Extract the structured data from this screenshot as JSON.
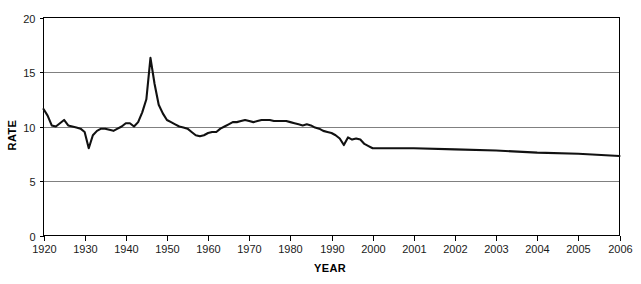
{
  "chart_data": {
    "type": "line",
    "title": "",
    "xlabel": "YEAR",
    "ylabel": "RATE",
    "ylim": [
      0,
      20
    ],
    "yticks": [
      0,
      5,
      10,
      15,
      20
    ],
    "grid": "horizontal",
    "legend": "none",
    "x_axis_note": "Non-linear axis: evenly spaced decade ticks 1920-2000, then evenly spaced single-year ticks 2001-2006",
    "xticks": [
      "1920",
      "1930",
      "1940",
      "1950",
      "1960",
      "1970",
      "1980",
      "1990",
      "2000",
      "2001",
      "2002",
      "2003",
      "2004",
      "2005",
      "2006"
    ],
    "series": [
      {
        "name": "Rate",
        "color": "#111111",
        "x": [
          1920,
          1921,
          1922,
          1923,
          1924,
          1925,
          1926,
          1927,
          1928,
          1929,
          1930,
          1931,
          1932,
          1933,
          1934,
          1935,
          1936,
          1937,
          1938,
          1939,
          1940,
          1941,
          1942,
          1943,
          1944,
          1945,
          1946,
          1947,
          1948,
          1949,
          1950,
          1951,
          1952,
          1953,
          1954,
          1955,
          1956,
          1957,
          1958,
          1959,
          1960,
          1961,
          1962,
          1963,
          1964,
          1965,
          1966,
          1967,
          1968,
          1969,
          1970,
          1971,
          1972,
          1973,
          1974,
          1975,
          1976,
          1977,
          1978,
          1979,
          1980,
          1981,
          1982,
          1983,
          1984,
          1985,
          1986,
          1987,
          1988,
          1989,
          1990,
          1991,
          1992,
          1993,
          1994,
          1995,
          1996,
          1997,
          1998,
          1999,
          2000,
          2001,
          2002,
          2003,
          2004,
          2005,
          2006
        ],
        "values": [
          11.6,
          11.0,
          10.1,
          10.0,
          10.3,
          10.6,
          10.1,
          10.0,
          9.9,
          9.8,
          9.5,
          8.0,
          9.2,
          9.6,
          9.8,
          9.8,
          9.7,
          9.6,
          9.8,
          10.0,
          10.3,
          10.3,
          10.0,
          10.4,
          11.3,
          12.5,
          16.3,
          13.9,
          12.0,
          11.2,
          10.6,
          10.4,
          10.2,
          10.0,
          9.9,
          9.8,
          9.5,
          9.2,
          9.1,
          9.2,
          9.4,
          9.5,
          9.5,
          9.8,
          10.0,
          10.2,
          10.4,
          10.4,
          10.5,
          10.6,
          10.5,
          10.4,
          10.5,
          10.6,
          10.6,
          10.6,
          10.5,
          10.5,
          10.5,
          10.5,
          10.4,
          10.3,
          10.2,
          10.1,
          10.2,
          10.1,
          9.9,
          9.8,
          9.6,
          9.5,
          9.4,
          9.2,
          8.9,
          8.3,
          9.0,
          8.8,
          8.9,
          8.8,
          8.4,
          8.2,
          8.0,
          8.0,
          7.9,
          7.8,
          7.6,
          7.5,
          7.3
        ]
      }
    ]
  },
  "axes": {
    "y_title": "RATE",
    "x_title": "YEAR",
    "y_tick_labels": [
      "20",
      "15",
      "10",
      "5",
      "0"
    ],
    "x_tick_labels": [
      "1920",
      "1930",
      "1940",
      "1950",
      "1960",
      "1970",
      "1980",
      "1990",
      "2000",
      "2001",
      "2002",
      "2003",
      "2004",
      "2005",
      "2006"
    ]
  },
  "colors": {
    "line": "#111111",
    "grid": "#808080",
    "border": "#000000",
    "background": "#ffffff",
    "text": "#1a1a1a"
  }
}
